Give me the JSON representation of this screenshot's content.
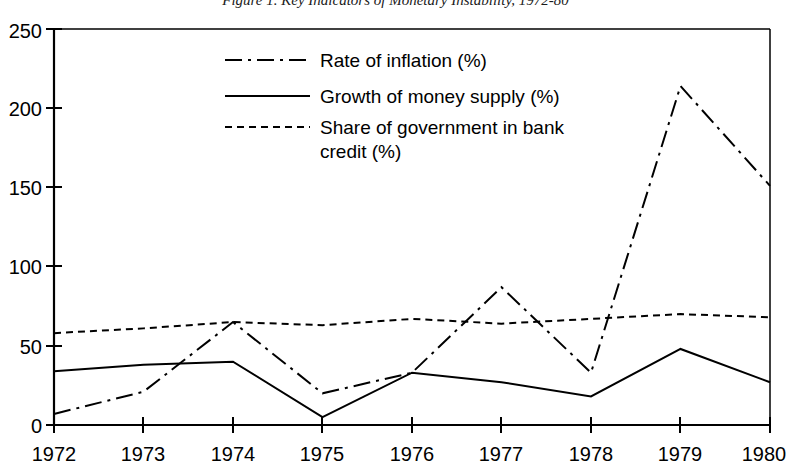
{
  "figure": {
    "title": "Figure 1. Key Indicators of Monetary Instability, 1972-80",
    "background": "#ffffff",
    "ink_color": "#000000"
  },
  "chart_data": {
    "type": "line",
    "title": "Figure 1. Key Indicators of Monetary Instability, 1972-80",
    "xlabel": "",
    "ylabel": "",
    "x": [
      1972,
      1973,
      1974,
      1975,
      1976,
      1977,
      1978,
      1979,
      1980
    ],
    "categories": [
      "1972",
      "1973",
      "1974",
      "1975",
      "1976",
      "1977",
      "1978",
      "1979",
      "1980"
    ],
    "xlim": [
      1972,
      1980
    ],
    "ylim": [
      0,
      250
    ],
    "yticks": [
      0,
      50,
      100,
      150,
      200,
      250
    ],
    "ytick_labels": [
      "0",
      "50",
      "100",
      "150",
      "200",
      "250"
    ],
    "xticks": [
      1972,
      1973,
      1974,
      1975,
      1976,
      1977,
      1978,
      1979,
      1980
    ],
    "xtick_labels": [
      "1972",
      "1973",
      "1974",
      "1975",
      "1976",
      "1977",
      "1978",
      "1979",
      "1980"
    ],
    "grid": false,
    "legend_position": "upper-left-inside",
    "series": [
      {
        "name": "Rate of inflation (%)",
        "style": "dash-dot",
        "color": "#000000",
        "values": [
          7,
          21,
          65,
          20,
          33,
          87,
          33,
          214,
          151
        ]
      },
      {
        "name": "Growth of money supply (%)",
        "style": "solid",
        "color": "#000000",
        "values": [
          34,
          38,
          40,
          5,
          33,
          27,
          18,
          48,
          27
        ]
      },
      {
        "name": "Share of government in bank credit (%)",
        "style": "dotted",
        "color": "#000000",
        "values": [
          58,
          61,
          65,
          63,
          67,
          64,
          67,
          70,
          68
        ]
      }
    ]
  },
  "legend": {
    "entries": [
      {
        "label": "Rate of inflation (%)",
        "style": "dash-dot"
      },
      {
        "label": "Growth of money supply (%)",
        "style": "solid"
      },
      {
        "label_line1": "Share of government in bank",
        "label_line2": "credit (%)",
        "style": "dotted"
      }
    ]
  }
}
